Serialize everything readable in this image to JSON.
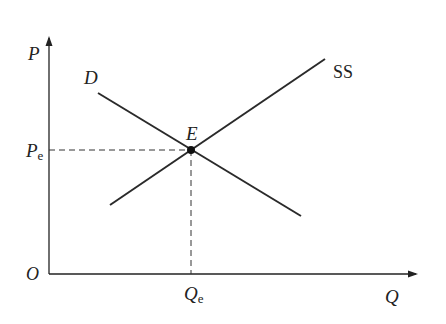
{
  "diagram": {
    "axes": {
      "y_label": "P",
      "x_label": "Q",
      "origin_label": "O"
    },
    "curves": [
      {
        "name": "demand",
        "label": "D",
        "from": [
          98,
          93
        ],
        "to": [
          301,
          216
        ]
      },
      {
        "name": "supply",
        "label": "SS",
        "from": [
          110,
          205
        ],
        "to": [
          325,
          59
        ]
      }
    ],
    "equilibrium": {
      "label": "E",
      "price_label_base": "P",
      "price_label_sub": "e",
      "quantity_label_base": "Q",
      "quantity_label_sub": "e",
      "point": [
        191,
        150
      ]
    },
    "colors": {
      "line": "#2a2a2a",
      "dash": "#333333"
    }
  }
}
